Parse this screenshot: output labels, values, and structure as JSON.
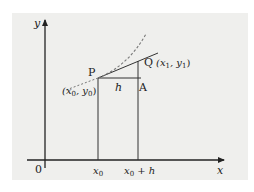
{
  "diagram": {
    "type": "derivative-secant-diagram",
    "colors": {
      "panel": "#efefed",
      "ink": "#222222",
      "dashed": "#777777"
    },
    "axes": {
      "x_label": "x",
      "y_label": "y",
      "origin_label": "0"
    },
    "ticks": {
      "x0": "x",
      "x0_sub": "0",
      "x0h_base": "x",
      "x0h_sub": "0",
      "x0h_suffix": " + h"
    },
    "points": {
      "P": {
        "label": "P",
        "coord_open": "(x",
        "coord_sub1": "0",
        "coord_mid": ", y",
        "coord_sub2": "0",
        "coord_close": ")"
      },
      "Q": {
        "label": "Q",
        "coord_open": "(x",
        "coord_sub1": "1",
        "coord_mid": ", y",
        "coord_sub2": "1",
        "coord_close": ")"
      },
      "A": {
        "label": "A"
      }
    },
    "segment_labels": {
      "h": "h"
    }
  }
}
